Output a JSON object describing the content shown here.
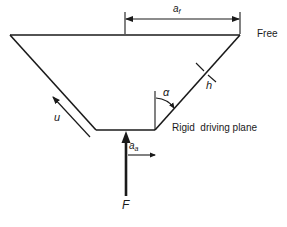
{
  "diagram": {
    "type": "trapezoidal-plate-schematic",
    "labels": {
      "free": "Free",
      "rigid_plane": "Rigid  driving plane",
      "force": "F",
      "velocity": "u",
      "angle": "α",
      "thickness": "h",
      "dim_top_base": "a",
      "dim_top_sub": "f",
      "dim_bottom_base": "a",
      "dim_bottom_sub": "a"
    },
    "colors": {
      "line": "#1a1a1a",
      "background": "#ffffff"
    },
    "geometry": {
      "top_edge": [
        [
          10,
          35
        ],
        [
          240,
          35
        ]
      ],
      "bottom_edge": [
        [
          96,
          130
        ],
        [
          155,
          130
        ]
      ],
      "left_edge": [
        [
          10,
          35
        ],
        [
          96,
          130
        ]
      ],
      "right_edge": [
        [
          155,
          130
        ],
        [
          240,
          35
        ]
      ]
    }
  }
}
